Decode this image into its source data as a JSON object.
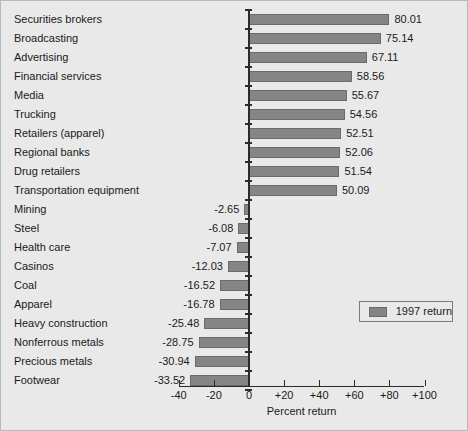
{
  "chart_data": {
    "type": "bar",
    "orientation": "horizontal",
    "title": "",
    "xlabel": "Percent return",
    "ylabel": "",
    "xlim": [
      -40,
      100
    ],
    "xticks": [
      -40,
      -20,
      0,
      20,
      40,
      60,
      80,
      100
    ],
    "xtick_labels": [
      "-40",
      "-20",
      "0",
      "+20",
      "+40",
      "+60",
      "+80",
      "+100"
    ],
    "grid": false,
    "legend": {
      "position": "middle-right",
      "entries": [
        "1997 return"
      ]
    },
    "series": [
      {
        "name": "1997 return",
        "color": "#858585",
        "values": [
          80.01,
          75.14,
          67.11,
          58.56,
          55.67,
          54.56,
          52.51,
          52.06,
          51.54,
          50.09,
          -2.65,
          -6.08,
          -7.07,
          -12.03,
          -16.52,
          -16.78,
          -25.48,
          -28.75,
          -30.94,
          -33.52
        ]
      }
    ],
    "categories": [
      "Securities brokers",
      "Broadcasting",
      "Advertising",
      "Financial services",
      "Media",
      "Trucking",
      "Retailers (apparel)",
      "Regional banks",
      "Drug retailers",
      "Transportation equipment",
      "Mining",
      "Steel",
      "Health care",
      "Casinos",
      "Coal",
      "Apparel",
      "Heavy construction",
      "Nonferrous metals",
      "Precious metals",
      "Footwear"
    ],
    "value_labels": [
      "80.01",
      "75.14",
      "67.11",
      "58.56",
      "55.67",
      "54.56",
      "52.51",
      "52.06",
      "51.54",
      "50.09",
      "-2.65",
      "-6.08",
      "-7.07",
      "-12.03",
      "-16.52",
      "-16.78",
      "-25.48",
      "-28.75",
      "-30.94",
      "-33.52"
    ]
  },
  "legend": {
    "label": "1997 return",
    "swatch_color": "#858585"
  },
  "axis": {
    "title": "Percent return",
    "tick_labels": [
      "-40",
      "-20",
      "0",
      "+20",
      "+40",
      "+60",
      "+80",
      "+100"
    ]
  },
  "colors": {
    "background": "#e9e9e9",
    "bar_fill": "#858585",
    "bar_edge": "#6b6b6b",
    "axis": "#2b2b2b",
    "text": "#1a1a1a"
  }
}
